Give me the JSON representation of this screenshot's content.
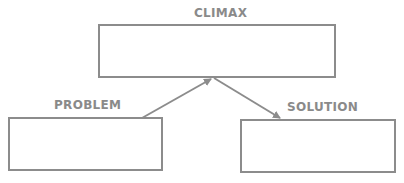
{
  "diagram": {
    "type": "story-structure",
    "stroke_color": "#8c8c8c",
    "text_color": "#8a8a8a",
    "nodes": [
      {
        "id": "climax",
        "label": "CLIMAX",
        "content": ""
      },
      {
        "id": "problem",
        "label": "PROBLEM",
        "content": ""
      },
      {
        "id": "solution",
        "label": "SOLUTION",
        "content": ""
      }
    ],
    "edges": [
      {
        "from": "problem",
        "to": "climax"
      },
      {
        "from": "climax",
        "to": "solution"
      }
    ]
  }
}
